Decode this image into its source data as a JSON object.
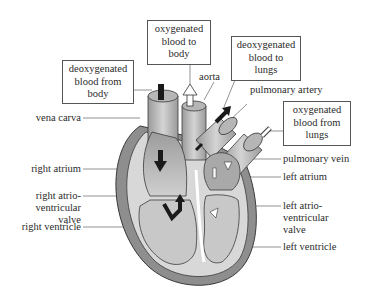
{
  "diagram": {
    "boxes": {
      "deoxy_from_body": [
        "deoxygenated",
        "blood from",
        "body"
      ],
      "oxy_to_body": [
        "oxygenated",
        "blood to",
        "body"
      ],
      "deoxy_to_lungs": [
        "deoxygenated",
        "blood to",
        "lungs"
      ],
      "oxy_from_lungs": [
        "oxygenated",
        "blood from",
        "lungs"
      ]
    },
    "labels": {
      "vena_cava": "vena carva",
      "aorta": "aorta",
      "pulmonary_artery": "pulmonary artery",
      "pulmonary_vein": "pulmonary vein",
      "left_atrium": "left atrium",
      "right_atrium": "right atrium",
      "right_av_valve": [
        "right atrio-",
        "ventricular",
        "valve"
      ],
      "left_av_valve": [
        "left atrio-",
        "ventricular",
        "valve"
      ],
      "right_ventricle": "right ventricle",
      "left_ventricle": "left ventricle"
    },
    "colors": {
      "outer_wall": "#8e8e8e",
      "chamber_fill": "#c8c8c8",
      "chamber_dark": "#a9a9a9",
      "vessel_fill": "#b9b9b9",
      "outline": "#3a3a3a",
      "arrow_deoxy": "#1a1a1a",
      "arrow_oxy": "#ffffff"
    }
  }
}
